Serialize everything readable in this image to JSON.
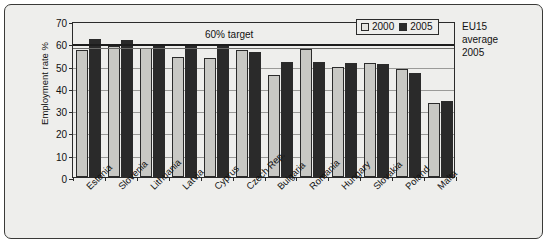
{
  "chart_data": {
    "type": "bar",
    "title": "",
    "subtitle": "",
    "xlabel": "",
    "ylabel": "Employment rate %",
    "ylim": [
      0,
      70
    ],
    "ytick_step": 10,
    "yticks": [
      "0",
      "10",
      "20",
      "30",
      "40",
      "50",
      "60",
      "70"
    ],
    "grid": true,
    "legend_position": "top-right",
    "categories": [
      "Estonia",
      "Slovenia",
      "Lithuania",
      "Latvia",
      "Cyprus",
      "Czech Rep.",
      "Bulgaria",
      "Romania",
      "Hungary",
      "Slovakia",
      "Poland",
      "Malta"
    ],
    "series": [
      {
        "name": "2000",
        "color": "#c8c8c4",
        "values": [
          57,
          59,
          58,
          54,
          53.5,
          57,
          46,
          57.5,
          49.5,
          51,
          48.5,
          33
        ]
      },
      {
        "name": "2005",
        "color": "#2a2a2a",
        "values": [
          62,
          61.5,
          59.5,
          59.5,
          59.5,
          56,
          51.5,
          51.5,
          51,
          50.5,
          46.5,
          34
        ]
      }
    ],
    "annotations": [
      {
        "name": "target-line",
        "label": "60% target",
        "value": 60,
        "kind": "horizontal-line"
      },
      {
        "name": "eu15-average-line",
        "label": "EU15 average 2005",
        "value": 59,
        "kind": "horizontal-line"
      }
    ]
  },
  "legend": {
    "items": [
      {
        "label": "2000",
        "color": "#c8c8c4"
      },
      {
        "label": "2005",
        "color": "#2a2a2a"
      }
    ]
  },
  "annotations": {
    "target_caption": "60% target",
    "eu_note_line1": "EU15",
    "eu_note_line2": "average",
    "eu_note_line3": "2005"
  }
}
